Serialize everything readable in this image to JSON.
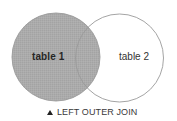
{
  "diagram": {
    "type": "venn",
    "title": "LEFT OUTER JOIN",
    "caption_icon": "triangle-up-icon",
    "sets": [
      {
        "id": "table1",
        "label": "table 1",
        "filled": true
      },
      {
        "id": "table2",
        "label": "table 2",
        "filled": false
      }
    ],
    "highlighted_region": "table 1 (including intersection with table 2)"
  },
  "labels": {
    "table1": "table 1",
    "table2": "table 2",
    "caption": "LEFT OUTER JOIN"
  },
  "colors": {
    "fill": "#ababab",
    "outline": "#9a9a9a",
    "background": "#ffffff",
    "text": "#2a2a2a"
  }
}
